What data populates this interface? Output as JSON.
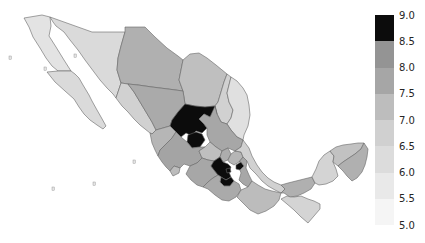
{
  "figure": {
    "kind": "static-plot",
    "background_color": "#ffffff",
    "title": ""
  },
  "chart_data": {
    "type": "heatmap",
    "subtype": "choropleth-map",
    "region": "Mexico (states)",
    "colormap": "grayscale, light = low value, dark = high value",
    "value_range": [
      5.0,
      9.0
    ],
    "legend": {
      "position": "right",
      "orientation": "vertical",
      "top_value": 9.0,
      "bottom_value": 5.0,
      "tick_step": 0.5,
      "tick_labels": [
        "9.0",
        "8.5",
        "8.0",
        "7.5",
        "7.0",
        "6.5",
        "6.0",
        "5.5",
        "5.0"
      ],
      "segment_colors_top_to_bottom": [
        "#0c0c0c",
        "#949494",
        "#a6a6a6",
        "#bdbdbd",
        "#d0d0d0",
        "#dcdcdc",
        "#e9e9e9",
        "#f5f5f5"
      ]
    },
    "border_color": "#666666",
    "dark_bin_color": "#0c0c0c",
    "states": [
      {
        "id": "bc",
        "name": "Baja California",
        "value": 5.7
      },
      {
        "id": "bcs",
        "name": "Baja California Sur",
        "value": 6.0
      },
      {
        "id": "son",
        "name": "Sonora",
        "value": 6.0
      },
      {
        "id": "chh",
        "name": "Chihuahua",
        "value": 7.4
      },
      {
        "id": "coa",
        "name": "Coahuila",
        "value": 6.9
      },
      {
        "id": "nle",
        "name": "Nuevo Leon",
        "value": 6.3
      },
      {
        "id": "tam",
        "name": "Tamaulipas",
        "value": 5.8
      },
      {
        "id": "sin",
        "name": "Sinaloa",
        "value": 6.3
      },
      {
        "id": "dur",
        "name": "Durango",
        "value": 7.6
      },
      {
        "id": "zac",
        "name": "Zacatecas",
        "value": 8.9
      },
      {
        "id": "ags",
        "name": "Aguascalientes",
        "value": 8.8
      },
      {
        "id": "slp",
        "name": "San Luis Potosi",
        "value": 7.7
      },
      {
        "id": "nay",
        "name": "Nayarit",
        "value": 7.2
      },
      {
        "id": "jal",
        "name": "Jalisco",
        "value": 7.8
      },
      {
        "id": "col",
        "name": "Colima",
        "value": 7.0
      },
      {
        "id": "gto",
        "name": "Guanajuato",
        "value": 6.9
      },
      {
        "id": "qro",
        "name": "Queretaro",
        "value": 7.5
      },
      {
        "id": "hid",
        "name": "Hidalgo",
        "value": 7.2
      },
      {
        "id": "mic",
        "name": "Michoacan",
        "value": 7.7
      },
      {
        "id": "mex",
        "name": "Estado de Mexico",
        "value": 8.8
      },
      {
        "id": "cmx",
        "name": "Ciudad de Mexico",
        "value": 8.7
      },
      {
        "id": "mor",
        "name": "Morelos",
        "value": 8.6
      },
      {
        "id": "tla",
        "name": "Tlaxcala",
        "value": 8.6
      },
      {
        "id": "pue",
        "name": "Puebla",
        "value": 7.7
      },
      {
        "id": "ver",
        "name": "Veracruz",
        "value": 6.3
      },
      {
        "id": "gro",
        "name": "Guerrero",
        "value": 7.6
      },
      {
        "id": "oax",
        "name": "Oaxaca",
        "value": 7.0
      },
      {
        "id": "chp",
        "name": "Chiapas",
        "value": 6.2
      },
      {
        "id": "tab",
        "name": "Tabasco",
        "value": 7.4
      },
      {
        "id": "cam",
        "name": "Campeche",
        "value": 6.2
      },
      {
        "id": "yuc",
        "name": "Yucatan",
        "value": 6.8
      },
      {
        "id": "roo",
        "name": "Quintana Roo",
        "value": 7.4
      }
    ],
    "islands": [
      {
        "id": "isla-guadalupe",
        "x": 9,
        "y": 56
      },
      {
        "id": "isla-cedros",
        "x": 44,
        "y": 67
      },
      {
        "id": "isla-tiburon",
        "x": 74,
        "y": 54
      },
      {
        "id": "islas-marias",
        "x": 133,
        "y": 160
      },
      {
        "id": "isla-socorro",
        "x": 93,
        "y": 182
      },
      {
        "id": "isla-revillagigedo",
        "x": 52,
        "y": 187
      }
    ]
  }
}
